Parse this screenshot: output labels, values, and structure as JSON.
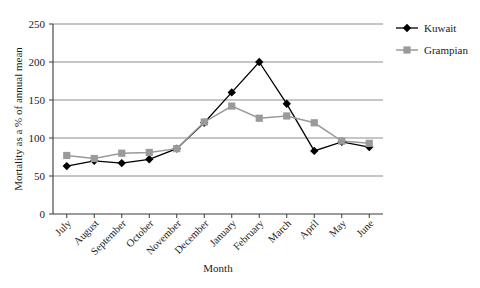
{
  "chart_data": {
    "type": "line",
    "title": "",
    "xlabel": "Month",
    "ylabel": "Mortality as a % of annual mean",
    "categories": [
      "July",
      "August",
      "September",
      "October",
      "November",
      "December",
      "January",
      "February",
      "March",
      "April",
      "May",
      "June"
    ],
    "series": [
      {
        "name": "Kuwait",
        "color": "#000000",
        "marker": "diamond",
        "values": [
          63,
          70,
          67,
          72,
          86,
          120,
          160,
          200,
          145,
          83,
          95,
          88
        ]
      },
      {
        "name": "Grampian",
        "color": "#9a9a9a",
        "marker": "square",
        "values": [
          77,
          73,
          80,
          81,
          86,
          121,
          142,
          126,
          129,
          120,
          96,
          93
        ]
      }
    ],
    "ylim": [
      0,
      250
    ],
    "yticks": [
      0,
      50,
      100,
      150,
      200,
      250
    ],
    "grid": true,
    "legend_position": "right"
  },
  "legend": {
    "entries": [
      {
        "label": "Kuwait"
      },
      {
        "label": "Grampian"
      }
    ]
  },
  "axes": {
    "y_title": "Mortality as a % of annual mean",
    "x_title": "Month"
  }
}
